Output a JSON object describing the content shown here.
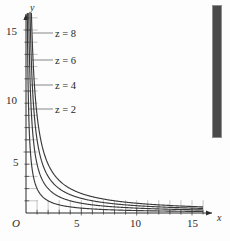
{
  "figure": {
    "background_color": "#fdfdfd",
    "ink_color": "#2b2b2b",
    "curve_color": "#3a3a3a",
    "grid_color": "#9a9a9a"
  },
  "axes": {
    "x_axis_name": "x",
    "y_axis_name": "y",
    "origin_label": "O",
    "x_tick_labels": [
      "5",
      "10",
      "15"
    ],
    "y_tick_labels": [
      "5",
      "10",
      "15"
    ]
  },
  "labels": {
    "z8": {
      "var": "z",
      "eq": "=",
      "value": "8",
      "text": "z = 8"
    },
    "z6": {
      "var": "z",
      "eq": "=",
      "value": "6",
      "text": "z = 6"
    },
    "z4": {
      "var": "z",
      "eq": "=",
      "value": "4",
      "text": "z = 4"
    },
    "z2": {
      "var": "z",
      "eq": "=",
      "value": "2",
      "text": "z = 2"
    }
  },
  "artifact": {
    "name": "scan-edge-bar",
    "color": "#4a4a4a"
  },
  "chart_data": {
    "type": "line",
    "title": "",
    "subtitle": "",
    "xlabel": "x",
    "ylabel": "y",
    "xlim": [
      0,
      16
    ],
    "ylim": [
      0,
      16.5
    ],
    "grid": true,
    "grid_spacing": 1,
    "legend": "inline-curve-labels",
    "x_ticks": [
      1,
      2,
      3,
      4,
      5,
      6,
      7,
      8,
      9,
      10,
      11,
      12,
      13,
      14,
      15,
      16
    ],
    "x_tick_labels_shown": [
      5,
      10,
      15
    ],
    "y_ticks": [
      1,
      2,
      3,
      4,
      5,
      6,
      7,
      8,
      9,
      10,
      11,
      12,
      13,
      14,
      15,
      16
    ],
    "y_tick_labels_shown": [
      5,
      10,
      15
    ],
    "equation": "z = x*y",
    "series": [
      {
        "name": "z = 2",
        "level": 2,
        "x": [
          0.125,
          0.15,
          0.2,
          0.25,
          0.3,
          0.4,
          0.5,
          0.6,
          0.8,
          1.0,
          1.25,
          1.5,
          2.0,
          2.5,
          3.0,
          4.0,
          5.0,
          6.0,
          7.0,
          8.0,
          10.0,
          12.0,
          14.0,
          16.0
        ],
        "values": [
          16.0,
          13.333,
          10.0,
          8.0,
          6.667,
          5.0,
          4.0,
          3.333,
          2.5,
          2.0,
          1.6,
          1.333,
          1.0,
          0.8,
          0.667,
          0.5,
          0.4,
          0.333,
          0.286,
          0.25,
          0.2,
          0.167,
          0.143,
          0.125
        ]
      },
      {
        "name": "z = 4",
        "level": 4,
        "x": [
          0.25,
          0.3,
          0.4,
          0.5,
          0.6,
          0.8,
          1.0,
          1.25,
          1.5,
          2.0,
          2.5,
          3.0,
          4.0,
          5.0,
          6.0,
          7.0,
          8.0,
          10.0,
          12.0,
          14.0,
          16.0
        ],
        "values": [
          16.0,
          13.333,
          10.0,
          8.0,
          6.667,
          5.0,
          4.0,
          3.2,
          2.667,
          2.0,
          1.6,
          1.333,
          1.0,
          0.8,
          0.667,
          0.571,
          0.5,
          0.4,
          0.333,
          0.286,
          0.25
        ]
      },
      {
        "name": "z = 6",
        "level": 6,
        "x": [
          0.375,
          0.45,
          0.6,
          0.75,
          0.9,
          1.2,
          1.5,
          1.875,
          2.25,
          3.0,
          3.75,
          4.5,
          6.0,
          7.5,
          9.0,
          10.5,
          12.0,
          14.0,
          16.0
        ],
        "values": [
          16.0,
          13.333,
          10.0,
          8.0,
          6.667,
          5.0,
          4.0,
          3.2,
          2.667,
          2.0,
          1.6,
          1.333,
          1.0,
          0.8,
          0.667,
          0.571,
          0.5,
          0.429,
          0.375
        ]
      },
      {
        "name": "z = 8",
        "level": 8,
        "x": [
          0.5,
          0.6,
          0.8,
          1.0,
          1.2,
          1.6,
          2.0,
          2.5,
          3.0,
          4.0,
          5.0,
          6.0,
          8.0,
          10.0,
          12.0,
          14.0,
          16.0
        ],
        "values": [
          16.0,
          13.333,
          10.0,
          8.0,
          6.667,
          5.0,
          4.0,
          3.2,
          2.667,
          2.0,
          1.6,
          1.333,
          1.0,
          0.8,
          0.667,
          0.571,
          0.5
        ]
      }
    ]
  }
}
